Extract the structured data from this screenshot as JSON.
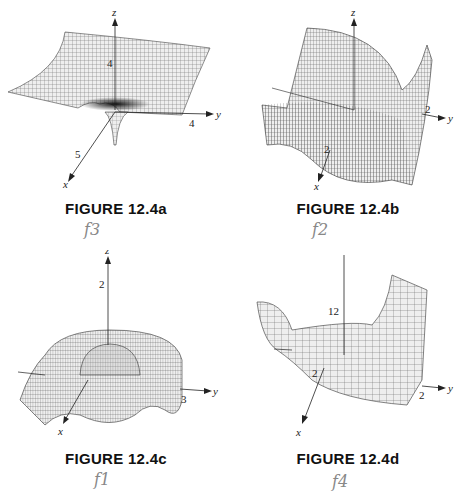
{
  "figures": [
    {
      "id": "a",
      "caption": "FIGURE 12.4a",
      "handwritten": "f3",
      "axes": {
        "x": "x",
        "y": "y",
        "z": "z"
      },
      "ticks": {
        "z": "4",
        "y": "4",
        "x": "5"
      },
      "description": "Surface that is high at corners, with a funnel-shaped spike dropping downward at the origin"
    },
    {
      "id": "b",
      "caption": "FIGURE 12.4b",
      "handwritten": "f2",
      "axes": {
        "x": "x",
        "y": "y",
        "z": "z"
      },
      "ticks": {
        "y": "2",
        "x": "2"
      },
      "description": "Wavy surface with a tall ridge at the back and a sharp peak on the right edge"
    },
    {
      "id": "c",
      "caption": "FIGURE 12.4c",
      "handwritten": "f1",
      "axes": {
        "x": "x",
        "y": "y",
        "z": "z"
      },
      "ticks": {
        "z": "2",
        "y": "3"
      },
      "description": "Radially oscillating surface: central dome surrounded by a circular trough and outer ring"
    },
    {
      "id": "d",
      "caption": "FIGURE 12.4d",
      "handwritten": "f4",
      "axes": {
        "x": "x",
        "y": "y",
        "z": "z"
      },
      "ticks": {
        "z": "12",
        "y": "2",
        "x": "2"
      },
      "description": "Mostly flat surface that rises steeply at the back-right corner and has a fold at the left"
    }
  ]
}
